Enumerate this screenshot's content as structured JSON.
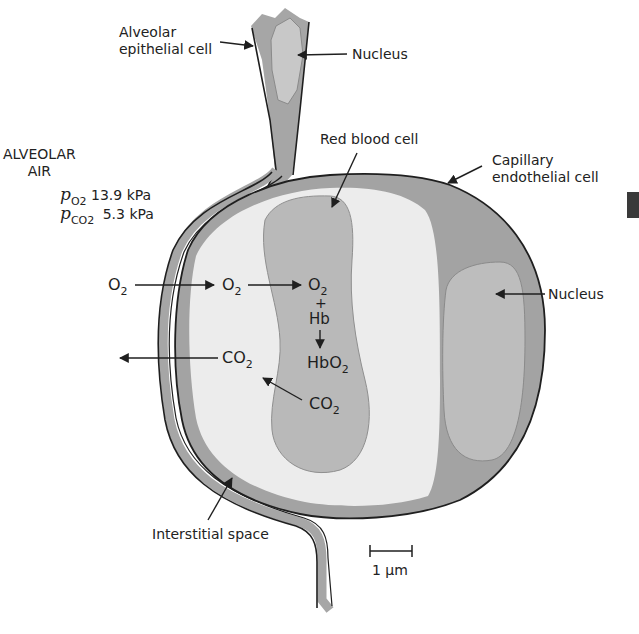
{
  "figure": {
    "type": "anatomical-cross-section",
    "colors": {
      "background": "#ffffff",
      "cell_dark": "#9c9c9c",
      "cell_mid": "#b8b8b8",
      "plasma": "#ececec",
      "outline": "#1f1f1f",
      "text": "#222222"
    }
  },
  "alveolar_air": {
    "title_line1": "ALVEOLAR",
    "title_line2": "AIR",
    "po2_symbol": "p",
    "po2_subscript": "O2",
    "po2_value": "13.9 kPa",
    "pco2_symbol": "p",
    "pco2_subscript": "CO2",
    "pco2_value": "5.3 kPa"
  },
  "labels": {
    "alveolar_epithelial_line1": "Alveolar",
    "alveolar_epithelial_line2": "epithelial cell",
    "nucleus_top": "Nucleus",
    "red_blood_cell": "Red blood cell",
    "capillary_endothelial_line1": "Capillary",
    "capillary_endothelial_line2": "endothelial cell",
    "nucleus_right": "Nucleus",
    "interstitial_space": "Interstitial space",
    "scale_bar": "1 µm"
  },
  "gas_exchange": {
    "o2_air": {
      "base": "O",
      "sub": "2"
    },
    "o2_plasma": {
      "base": "O",
      "sub": "2"
    },
    "o2_rbc": {
      "base": "O",
      "sub": "2"
    },
    "plus": "+",
    "hb": "Hb",
    "hbo2": {
      "base": "HbO",
      "sub": "2"
    },
    "co2_plasma": {
      "base": "CO",
      "sub": "2"
    },
    "co2_rbc": {
      "base": "CO",
      "sub": "2"
    }
  }
}
